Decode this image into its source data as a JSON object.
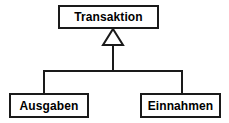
{
  "diagram": {
    "type": "uml-class-generalization",
    "title_text": "",
    "background_color": "#ffffff",
    "line_color": "#1a1a1a",
    "text_color": "#000000",
    "nodes": [
      {
        "id": "transaktion",
        "label": "Transaktion",
        "role": "superclass"
      },
      {
        "id": "ausgaben",
        "label": "Ausgaben",
        "role": "subclass"
      },
      {
        "id": "einnahmen",
        "label": "Einnahmen",
        "role": "subclass"
      }
    ],
    "edges": [
      {
        "id": "edge-ausgaben-transaktion",
        "from": "ausgaben",
        "to": "transaktion",
        "kind": "generalization",
        "arrowhead": "hollow-triangle"
      },
      {
        "id": "edge-einnahmen-transaktion",
        "from": "einnahmen",
        "to": "transaktion",
        "kind": "generalization",
        "arrowhead": "hollow-triangle"
      }
    ]
  }
}
